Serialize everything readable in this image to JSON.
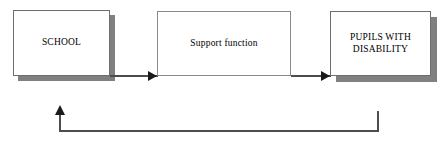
{
  "diagram": {
    "type": "process-flow",
    "title": "",
    "nodes": [
      {
        "id": "school",
        "label": "SCHOOL",
        "shape": "rectangle",
        "has_shadow": true,
        "text_case": "uppercase"
      },
      {
        "id": "support",
        "label": "Support function",
        "shape": "rectangle",
        "has_shadow": false,
        "text_case": "none"
      },
      {
        "id": "pupils",
        "label": "PUPILS WITH\nDISABILITY",
        "shape": "rectangle",
        "has_shadow": true,
        "text_case": "uppercase"
      }
    ],
    "edges": [
      {
        "id": "school-to-support",
        "from": "school",
        "to": "support",
        "label": "",
        "direction": "right",
        "style": "solid"
      },
      {
        "id": "support-to-pupils",
        "from": "support",
        "to": "pupils",
        "label": "",
        "direction": "right",
        "style": "solid"
      },
      {
        "id": "pupils-to-school-feedback",
        "from": "pupils",
        "to": "school",
        "label": "",
        "direction": "up",
        "style": "solid-orthogonal-feedback"
      }
    ],
    "colors": {
      "background": "#ffffff",
      "node_fill": "#ffffff",
      "node_border": "#6e6e6e",
      "shadow": "#808080",
      "connector": "#4d4d4d",
      "arrowhead": "#1a1a1a",
      "text": "#000000"
    }
  }
}
